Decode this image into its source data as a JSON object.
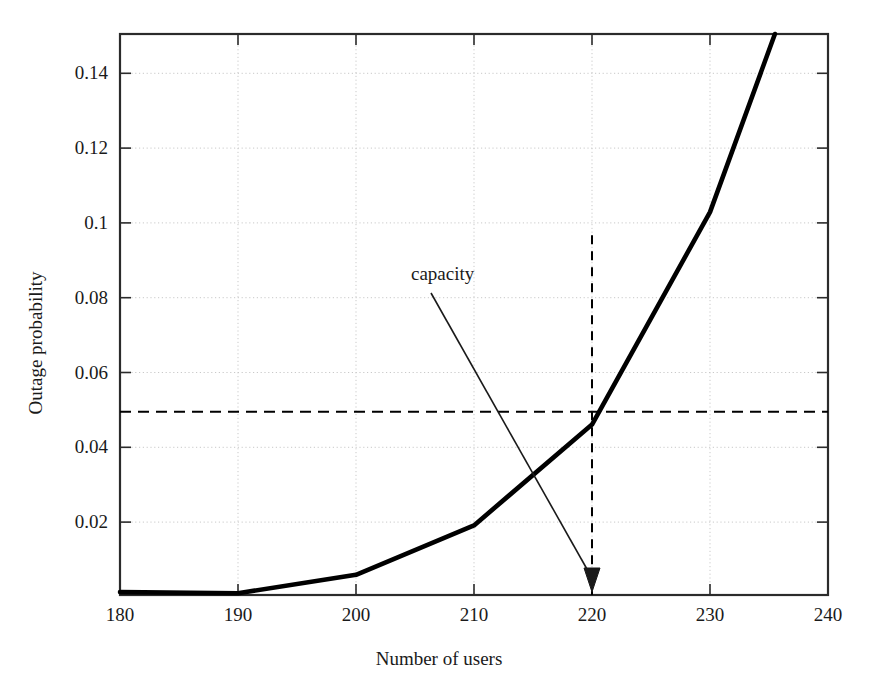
{
  "chart_data": {
    "type": "line",
    "title": "",
    "xlabel": "Number of users",
    "ylabel": "Outage probability",
    "xlim": [
      180,
      240
    ],
    "ylim": [
      0,
      0.1531
    ],
    "grid": true,
    "grid_style": "dotted",
    "legend": "none",
    "xticks": [
      "180",
      "190",
      "200",
      "210",
      "220",
      "230",
      "240"
    ],
    "xtick_values": [
      180,
      190,
      200,
      210,
      220,
      230,
      240
    ],
    "yticks": [
      "0.02",
      "0.04",
      "0.06",
      "0.08",
      "0.1",
      "0.12",
      "0.14"
    ],
    "ytick_values": [
      0.02,
      0.04,
      0.06,
      0.08,
      0.1,
      0.12,
      0.14
    ],
    "series": [
      {
        "name": "outage probability",
        "style": "solid",
        "width": 4,
        "color": "#000000",
        "x": [
          180,
          190,
          200,
          210,
          220,
          230,
          235.5
        ],
        "values": [
          0.0008,
          0.0005,
          0.0055,
          0.019,
          0.0465,
          0.1045,
          0.1531
        ]
      }
    ],
    "reference_lines": [
      {
        "name": "target-outage-level",
        "orientation": "horizontal",
        "value": 0.05,
        "style": "dashed",
        "color": "#000000"
      },
      {
        "name": "capacity-level",
        "orientation": "vertical",
        "value": 220,
        "style": "dashed",
        "color": "#000000",
        "y_from": 0,
        "y_to": 0.0982
      }
    ],
    "annotations": [
      {
        "name": "capacity",
        "text": "capacity",
        "text_x": 411,
        "text_y": 274,
        "arrow_from_x": 431,
        "arrow_from_y": 293,
        "arrow_to_x": 595,
        "arrow_to_y": 592
      }
    ]
  },
  "figure": {
    "plot_left": 120,
    "plot_right": 828,
    "plot_top": 34,
    "plot_bottom": 595,
    "frame_color": "#2b2b2b",
    "grid_color": "#c8c8c8",
    "background": "#ffffff"
  }
}
